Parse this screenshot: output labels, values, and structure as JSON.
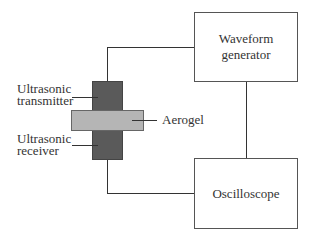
{
  "diagram": {
    "title": "",
    "nodes": {
      "waveform_generator": {
        "label_line1": "Waveform",
        "label_line2": "generator"
      },
      "oscilloscope": {
        "label": "Oscilloscope"
      },
      "transmitter": {
        "label_line1": "Ultrasonic",
        "label_line2": "transmitter"
      },
      "receiver": {
        "label_line1": "Ultrasonic",
        "label_line2": "receiver"
      },
      "aerogel": {
        "label": "Aerogel"
      }
    },
    "edges": [
      {
        "from": "transmitter",
        "to": "waveform_generator"
      },
      {
        "from": "waveform_generator",
        "to": "oscilloscope"
      },
      {
        "from": "receiver",
        "to": "oscilloscope"
      }
    ],
    "colors": {
      "transducer": "#5a5a5a",
      "aerogel": "#b5b5b5",
      "line": "#333333"
    }
  }
}
